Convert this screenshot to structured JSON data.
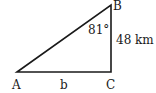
{
  "diagram": {
    "type": "right-triangle",
    "vertices": {
      "A": {
        "label": "A",
        "x": 17,
        "y": 72
      },
      "B": {
        "label": "B",
        "x": 111,
        "y": 5
      },
      "C": {
        "label": "C",
        "x": 111,
        "y": 72
      }
    },
    "angle_B": "81°",
    "side_BC": "48 km",
    "side_AC": "b",
    "colors": {
      "stroke": "#1a1a1a",
      "background": "#ffffff"
    }
  }
}
